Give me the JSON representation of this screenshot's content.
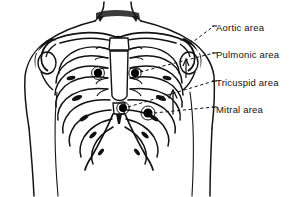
{
  "figure": {
    "kind": "anatomical-illustration",
    "background_color": "#ffffff",
    "ink_color": "#111111"
  },
  "labels": [
    {
      "id": "aortic",
      "text": "Aortic area",
      "x": 216,
      "y": 23,
      "icon": "label-text"
    },
    {
      "id": "pulmonic",
      "text": "Pulmonic area",
      "x": 216,
      "y": 50,
      "icon": "label-text"
    },
    {
      "id": "tricuspid",
      "text": "Tricuspid area",
      "x": 216,
      "y": 78,
      "icon": "label-text"
    },
    {
      "id": "mitral",
      "text": "Mitral area",
      "x": 216,
      "y": 105,
      "icon": "label-text"
    }
  ],
  "markers": [
    {
      "id": "aortic-marker",
      "label": "Aortic area",
      "x": 98,
      "y": 73,
      "r": 4.2
    },
    {
      "id": "pulmonic-marker",
      "label": "Pulmonic area",
      "x": 135,
      "y": 73,
      "r": 4.0
    },
    {
      "id": "tricuspid-marker",
      "label": "Tricuspid area",
      "x": 123,
      "y": 108,
      "r": 4.0
    },
    {
      "id": "mitral-marker",
      "label": "Mitral area",
      "x": 148,
      "y": 113,
      "r": 4.6
    }
  ],
  "leader_lines": [
    {
      "id": "aortic-leader",
      "from_x": 196,
      "from_y": 42,
      "to_x": 214,
      "to_y": 26,
      "style": "dashed"
    },
    {
      "id": "pulmonic-leader",
      "from_x": 139,
      "from_y": 73,
      "to_x": 214,
      "to_y": 53,
      "style": "dashed"
    },
    {
      "id": "tricuspid-leader",
      "from_x": 127,
      "from_y": 108,
      "to_x": 214,
      "to_y": 81,
      "style": "dashed"
    },
    {
      "id": "mitral-leader",
      "from_x": 153,
      "from_y": 113,
      "to_x": 214,
      "to_y": 108,
      "style": "dashed"
    }
  ],
  "pointer_arrow": {
    "id": "tricuspid-arrow",
    "x": 173,
    "y": 112,
    "tip_y": 90,
    "direction": "up"
  }
}
